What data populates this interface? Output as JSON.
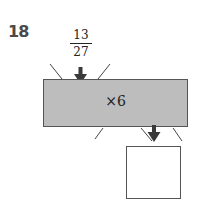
{
  "problem": {
    "number": "18",
    "input": {
      "numerator": "13",
      "denominator": "27"
    },
    "operation": "×6",
    "output_value": ""
  },
  "colors": {
    "machine_fill": "#bdbdbd",
    "arrow": "#3a3a3a",
    "border": "#555555"
  }
}
